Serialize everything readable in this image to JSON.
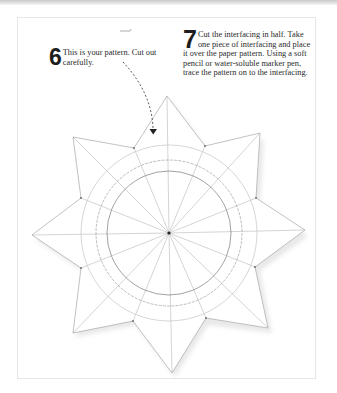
{
  "page": {
    "background": "#ffffff",
    "top_band_color": "#cfcfcf",
    "card_border_color": "#e6e6e6"
  },
  "steps": [
    {
      "number": "6",
      "text": "This is your pattern. Cut out carefully."
    },
    {
      "number": "7",
      "text": "Cut the interfacing in half. Take one piece of interfacing and place it over the paper pattern. Using a soft pencil or water-soluble marker pen, trace the pattern on to the interfacing."
    }
  ],
  "pattern": {
    "shape": "eight-pointed star",
    "center": [
      169,
      233
    ],
    "radial_lines": 16,
    "circles": [
      {
        "name": "inner-circle",
        "radius": 62,
        "style": "solid-dark"
      },
      {
        "name": "middle-circle",
        "radius": 73,
        "style": "dashed"
      },
      {
        "name": "outer-circle",
        "radius": 88,
        "style": "light"
      }
    ],
    "line_color": "#9a9a9a",
    "arrow": {
      "from": [
        122,
        62
      ],
      "to": [
        153,
        133
      ],
      "style": "dashed"
    }
  }
}
